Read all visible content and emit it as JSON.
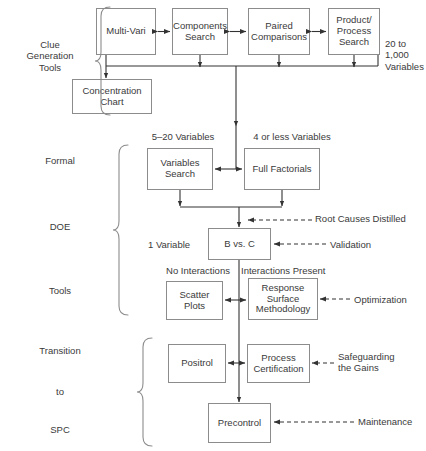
{
  "diagram": {
    "type": "flowchart",
    "stroke_color": "#8c8c8c",
    "text_color": "#3a3a3a",
    "background": "#ffffff"
  },
  "stage_labels": [
    {
      "id": "clue-generation-tools",
      "text": "Clue\nGeneration\nTools"
    },
    {
      "id": "formal",
      "text": "Formal"
    },
    {
      "id": "doe",
      "text": "DOE"
    },
    {
      "id": "tools",
      "text": "Tools"
    },
    {
      "id": "transition",
      "text": "Transition"
    },
    {
      "id": "to",
      "text": "to"
    },
    {
      "id": "spc",
      "text": "SPC"
    }
  ],
  "nodes": [
    {
      "id": "multi-vari",
      "label": "Multi-Vari"
    },
    {
      "id": "components-search",
      "label": "Components\nSearch"
    },
    {
      "id": "paired-comparisons",
      "label": "Paired\nComparisons"
    },
    {
      "id": "product-process-search",
      "label": "Product/\nProcess\nSearch"
    },
    {
      "id": "concentration-chart",
      "label": "Concentration\nChart"
    },
    {
      "id": "variables-search",
      "label": "Variables\nSearch"
    },
    {
      "id": "full-factorials",
      "label": "Full Factorials"
    },
    {
      "id": "b-vs-c",
      "label": "B vs. C"
    },
    {
      "id": "scatter-plots",
      "label": "Scatter\nPlots"
    },
    {
      "id": "response-surface-methodology",
      "label": "Response\nSurface\nMethodology"
    },
    {
      "id": "positrol",
      "label": "Positrol"
    },
    {
      "id": "process-certification",
      "label": "Process\nCertification"
    },
    {
      "id": "precontrol",
      "label": "Precontrol"
    }
  ],
  "annotations": [
    {
      "id": "variable-count-top",
      "text": "20 to\n1,000\nVariables"
    },
    {
      "id": "five-to-twenty-variables",
      "text": "5–20 Variables"
    },
    {
      "id": "four-or-less-variables",
      "text": "4 or less Variables"
    },
    {
      "id": "root-causes-distilled",
      "text": "Root Causes Distilled"
    },
    {
      "id": "one-variable",
      "text": "1 Variable"
    },
    {
      "id": "validation",
      "text": "Validation"
    },
    {
      "id": "no-interactions",
      "text": "No Interactions"
    },
    {
      "id": "interactions-present",
      "text": "Interactions Present"
    },
    {
      "id": "optimization",
      "text": "Optimization"
    },
    {
      "id": "safeguarding-the-gains",
      "text": "Safeguarding\nthe Gains"
    },
    {
      "id": "maintenance",
      "text": "Maintenance"
    }
  ]
}
